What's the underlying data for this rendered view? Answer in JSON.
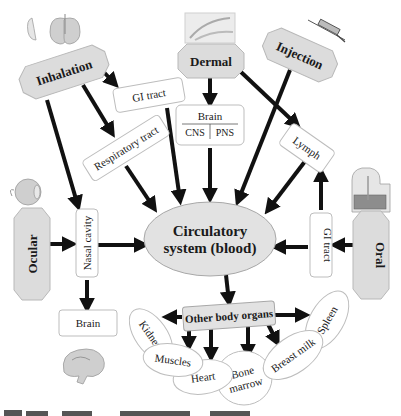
{
  "routes": {
    "inhalation": "Inhalation",
    "dermal": "Dermal",
    "injection": "Injection",
    "ocular": "Ocular",
    "oral": "Oral"
  },
  "intermediates": {
    "gi_tract_top": "GI tract",
    "respiratory_tract": "Respiratory tract",
    "brain_top": "Brain",
    "cns": "CNS",
    "pns": "PNS",
    "lymph": "Lymph",
    "nasal_cavity": "Nasal cavity",
    "gi_tract_right": "GI tract",
    "brain_bottom": "Brain"
  },
  "hub": {
    "line1": "Circulatory",
    "line2": "system (blood)"
  },
  "other_organs": {
    "label": "Other body organs",
    "organs": [
      "Kidney",
      "Muscles",
      "Heart",
      "Bone",
      "marrow",
      "Breast milk",
      "Spleen"
    ]
  },
  "icons": [
    "lungs-icon",
    "hand-skin-icon",
    "syringe-icon",
    "eye-icon",
    "digestive-system-icon",
    "brain-icon"
  ],
  "colors": {
    "route_fill": "#dcdcdc",
    "hub_fill": "#e2e2e2",
    "arrow": "#111111",
    "box_border": "#bdbdbd"
  }
}
